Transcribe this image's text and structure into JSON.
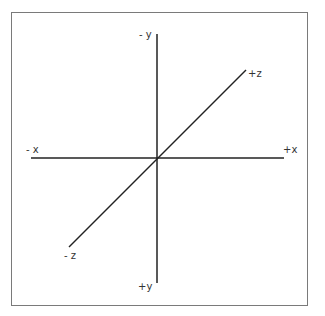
{
  "diagram": {
    "type": "3d-coordinate-axes",
    "axes": [
      {
        "name": "x",
        "negative_label": "- x",
        "positive_label": "+x"
      },
      {
        "name": "y",
        "negative_label": "- y",
        "positive_label": "+y"
      },
      {
        "name": "z",
        "negative_label": "- z",
        "positive_label": "+z"
      }
    ],
    "colors": {
      "axis": "#222222",
      "border": "#7a7a7a",
      "label": "#333333",
      "background": "#ffffff"
    }
  }
}
